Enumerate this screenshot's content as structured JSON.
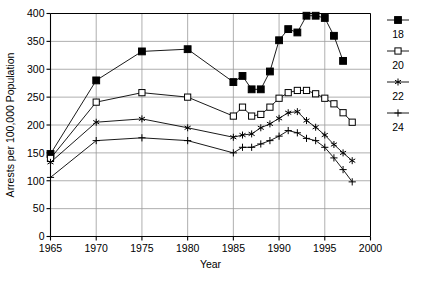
{
  "chart_data": {
    "type": "line",
    "title": "",
    "xlabel": "Year",
    "ylabel": "Arrests per 100,000 Population",
    "xlim": [
      1965,
      2000
    ],
    "ylim": [
      0,
      400
    ],
    "xticks": [
      1965,
      1970,
      1975,
      1980,
      1985,
      1990,
      1995,
      2000
    ],
    "yticks": [
      0,
      50,
      100,
      150,
      200,
      250,
      300,
      350,
      400
    ],
    "grid": true,
    "legend_position": "right",
    "series": [
      {
        "name": "18",
        "marker": "filled-square",
        "x": [
          1965,
          1970,
          1975,
          1980,
          1985,
          1986,
          1987,
          1988,
          1989,
          1990,
          1991,
          1992,
          1993,
          1994,
          1995,
          1996,
          1997
        ],
        "values": [
          148,
          280,
          332,
          336,
          277,
          288,
          264,
          264,
          296,
          352,
          372,
          366,
          396,
          396,
          392,
          360,
          315
        ]
      },
      {
        "name": "20",
        "marker": "open-square",
        "x": [
          1965,
          1970,
          1975,
          1980,
          1985,
          1986,
          1987,
          1988,
          1989,
          1990,
          1991,
          1992,
          1993,
          1994,
          1995,
          1996,
          1997,
          1998
        ],
        "values": [
          140,
          241,
          258,
          250,
          216,
          232,
          216,
          219,
          232,
          248,
          258,
          262,
          262,
          256,
          248,
          238,
          222,
          205
        ]
      },
      {
        "name": "22",
        "marker": "asterisk",
        "x": [
          1965,
          1970,
          1975,
          1980,
          1985,
          1986,
          1987,
          1988,
          1989,
          1990,
          1991,
          1992,
          1993,
          1994,
          1995,
          1996,
          1997,
          1998
        ],
        "values": [
          133,
          205,
          211,
          195,
          178,
          182,
          184,
          195,
          202,
          212,
          222,
          224,
          208,
          196,
          182,
          165,
          150,
          136
        ]
      },
      {
        "name": "24",
        "marker": "plus",
        "x": [
          1965,
          1970,
          1975,
          1980,
          1985,
          1986,
          1987,
          1988,
          1989,
          1990,
          1991,
          1992,
          1993,
          1994,
          1995,
          1996,
          1997,
          1998
        ],
        "values": [
          106,
          172,
          177,
          172,
          150,
          160,
          160,
          166,
          172,
          180,
          190,
          186,
          176,
          172,
          160,
          141,
          120,
          98
        ]
      }
    ]
  },
  "legend": {
    "entries": [
      {
        "label": "18",
        "marker": "filled-square"
      },
      {
        "label": "20",
        "marker": "open-square"
      },
      {
        "label": "22",
        "marker": "asterisk"
      },
      {
        "label": "24",
        "marker": "plus"
      }
    ]
  },
  "colors": {
    "line": "#000000",
    "grid": "#9a9a9a",
    "axis": "#000000",
    "background": "#ffffff"
  }
}
